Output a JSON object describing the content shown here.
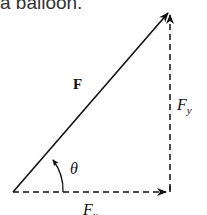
{
  "caption": "a balloon.",
  "labels": {
    "force": "F",
    "fy_main": "F",
    "fy_sub": "y",
    "theta": "θ",
    "fx_main": "F",
    "fx_sub": "x"
  }
}
